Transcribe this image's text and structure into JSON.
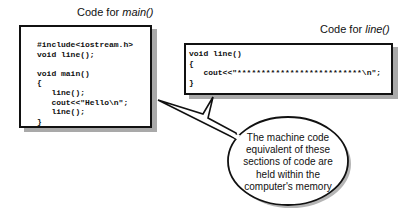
{
  "main_panel": {
    "title_prefix": "Code for ",
    "title_func": "main()",
    "code_lines": [
      "#include<iostream.h>",
      "void line();",
      "",
      "void main()",
      "{",
      "   line();",
      "   cout<<\"Hello\\n\";",
      "   line();",
      "}"
    ]
  },
  "line_panel": {
    "title_prefix": "Code for ",
    "title_func": "line()",
    "code_lines": [
      "void line()",
      "{",
      "   cout<<\"**************************\\n\";",
      "}"
    ]
  },
  "callout": {
    "text": "The machine code equivalent of these sections of code are held within the computer's memory"
  }
}
